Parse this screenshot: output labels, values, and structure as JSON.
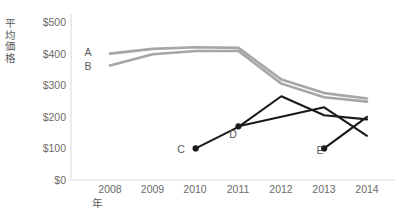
{
  "chart_data": {
    "type": "line",
    "title": "",
    "xlabel": "年",
    "ylabel": "平均価格",
    "categories": [
      "2008",
      "2009",
      "2010",
      "2011",
      "2012",
      "2013",
      "2014"
    ],
    "x": [
      2008,
      2009,
      2010,
      2011,
      2012,
      2013,
      2014
    ],
    "ylim": [
      0,
      500
    ],
    "yticks": [
      0,
      100,
      200,
      300,
      400,
      500
    ],
    "ytick_labels": [
      "$0",
      "$100",
      "$200",
      "$300",
      "$400",
      "$500"
    ],
    "grid": false,
    "legend_position": "inline-labels",
    "series": [
      {
        "name": "A",
        "color": "#a6a6a6",
        "markers": false,
        "x": [
          2008,
          2009,
          2010,
          2011,
          2012,
          2013,
          2014
        ],
        "values": [
          400,
          415,
          420,
          418,
          318,
          275,
          258
        ]
      },
      {
        "name": "B",
        "color": "#a6a6a6",
        "markers": false,
        "x": [
          2008,
          2009,
          2010,
          2011,
          2012,
          2013,
          2014
        ],
        "values": [
          362,
          398,
          408,
          408,
          305,
          262,
          248
        ]
      },
      {
        "name": "C",
        "color": "#1a1a1a",
        "markers": true,
        "x": [
          2010,
          2011,
          2012,
          2013,
          2014
        ],
        "values": [
          100,
          168,
          265,
          205,
          192
        ]
      },
      {
        "name": "D",
        "color": "#1a1a1a",
        "markers": true,
        "x": [
          2011,
          2012,
          2013,
          2014
        ],
        "values": [
          170,
          200,
          230,
          140
        ]
      },
      {
        "name": "E",
        "color": "#1a1a1a",
        "markers": true,
        "x": [
          2013,
          2014
        ],
        "values": [
          100,
          200
        ]
      }
    ],
    "axis_color": "#d9d9d9",
    "series_labels": [
      {
        "name": "A",
        "text": "A",
        "x": 88,
        "y": 52
      },
      {
        "name": "B",
        "text": "B",
        "x": 88,
        "y": 66
      },
      {
        "name": "C",
        "text": "C",
        "x": 181,
        "y": 149
      },
      {
        "name": "D",
        "text": "D",
        "x": 233,
        "y": 134
      },
      {
        "name": "E",
        "text": "E",
        "x": 320,
        "y": 150
      }
    ]
  },
  "axis": {
    "y_title": "平均価格",
    "x_title": "年",
    "y_tick_labels": [
      "$500",
      "$400",
      "$300",
      "$200",
      "$100",
      "$0"
    ],
    "x_tick_labels": [
      "2008",
      "2009",
      "2010",
      "2011",
      "2012",
      "2013",
      "2014"
    ]
  }
}
